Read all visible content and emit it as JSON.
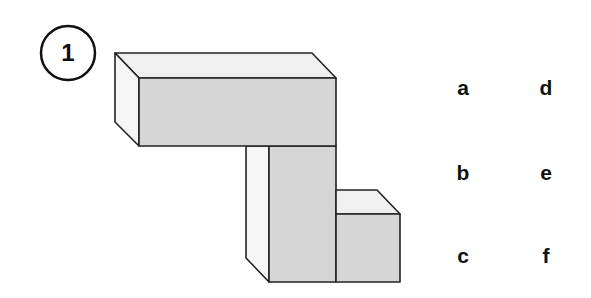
{
  "question": {
    "number": "1"
  },
  "figure": {
    "colors": {
      "front_face": "#d6d6d6",
      "top_face": "#f0f0f0",
      "side_face": "#f5f5f5",
      "edge": "#222222"
    }
  },
  "options": {
    "col1": [
      "a",
      "b",
      "c"
    ],
    "col2": [
      "d",
      "e",
      "f"
    ]
  }
}
